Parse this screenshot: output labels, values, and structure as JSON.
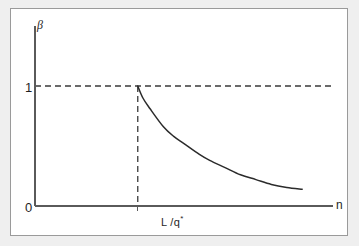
{
  "chart_data": {
    "type": "line",
    "title": "",
    "subtitle": "",
    "xlabel": "n",
    "ylabel": "β",
    "xlim": [
      0,
      2.9
    ],
    "ylim": [
      0,
      1.18
    ],
    "grid": false,
    "legend": null,
    "axis": {
      "y_label": "β",
      "y_ticks": [
        "0",
        "1"
      ],
      "y_tick_values": [
        0,
        1
      ],
      "x_label": "n",
      "x_ticks": [
        "L /q*"
      ],
      "x_tick_values": [
        1.0
      ],
      "x_tick_label_base": "L /q",
      "x_tick_label_sup": "*"
    },
    "annotations": [
      {
        "name": "beta-equals-one-reference",
        "kind": "horizontal-dashed-line",
        "y": 1.0,
        "label": "1"
      },
      {
        "name": "threshold-reference",
        "kind": "vertical-dashed-line",
        "x": 1.0,
        "label": "L /q*"
      }
    ],
    "series": [
      {
        "name": "beta",
        "style": "solid",
        "color": "#2b2b2b",
        "points": [
          {
            "x": 1.0,
            "y": 1.0
          },
          {
            "x": 1.05,
            "y": 0.9
          },
          {
            "x": 1.12,
            "y": 0.81
          },
          {
            "x": 1.25,
            "y": 0.66
          },
          {
            "x": 1.35,
            "y": 0.58
          },
          {
            "x": 1.45,
            "y": 0.52
          },
          {
            "x": 1.6,
            "y": 0.43
          },
          {
            "x": 1.7,
            "y": 0.38
          },
          {
            "x": 1.85,
            "y": 0.32
          },
          {
            "x": 2.0,
            "y": 0.26
          },
          {
            "x": 2.15,
            "y": 0.22
          },
          {
            "x": 2.3,
            "y": 0.18
          },
          {
            "x": 2.45,
            "y": 0.155
          },
          {
            "x": 2.6,
            "y": 0.14
          }
        ]
      }
    ]
  },
  "figure": {
    "y_axis_title": "β",
    "y_tick_one": "1",
    "y_tick_zero": "0",
    "x_axis_title": "n",
    "x_tick_threshold_base": "L /q",
    "x_tick_threshold_sup": "*"
  },
  "colors": {
    "page_background": "#efefef",
    "plot_background": "#ffffff",
    "frame_border": "#9a9a9a",
    "axis": "#5a5a5a",
    "curve": "#2b2b2b",
    "dashed_guide": "#3a3a3a",
    "text": "#1f1f1f"
  }
}
